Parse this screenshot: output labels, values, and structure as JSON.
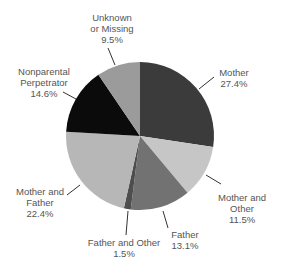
{
  "chart_data": {
    "type": "pie",
    "title": "",
    "start_angle": "12 o'clock",
    "direction": "clockwise",
    "slices": [
      {
        "label": "Mother",
        "value": 27.4,
        "display": "27.4%",
        "color": "#3b3b3b"
      },
      {
        "label": "Mother and Other",
        "value": 11.5,
        "display": "11.5%",
        "color": "#c6c6c6"
      },
      {
        "label": "Father",
        "value": 13.1,
        "display": "13.1%",
        "color": "#727272"
      },
      {
        "label": "Father and Other",
        "value": 1.5,
        "display": "1.5%",
        "color": "#4e4e4e"
      },
      {
        "label": "Mother and Father",
        "value": 22.4,
        "display": "22.4%",
        "color": "#b7b7b7"
      },
      {
        "label": "Nonparental Perpetrator",
        "value": 14.6,
        "display": "14.6%",
        "color": "#0b0b0b"
      },
      {
        "label": "Unknown or Missing",
        "value": 9.5,
        "display": "9.5%",
        "color": "#9b9b9b"
      }
    ],
    "legend": "none (leader-line labels)"
  },
  "labels": {
    "mother": {
      "line1": "Mother",
      "line2": "27.4%"
    },
    "mother_other": {
      "line1": "Mother and",
      "line2": "Other",
      "line3": "11.5%"
    },
    "father": {
      "line1": "Father",
      "line2": "13.1%"
    },
    "father_other": {
      "line1": "Father and Other",
      "line2": "1.5%"
    },
    "mother_father": {
      "line1": "Mother and",
      "line2": "Father",
      "line3": "22.4%"
    },
    "nonparental": {
      "line1": "Nonparental",
      "line2": "Perpetrator",
      "line3": "14.6%"
    },
    "unknown": {
      "line1": "Unknown",
      "line2": "or Missing",
      "line3": "9.5%"
    }
  }
}
